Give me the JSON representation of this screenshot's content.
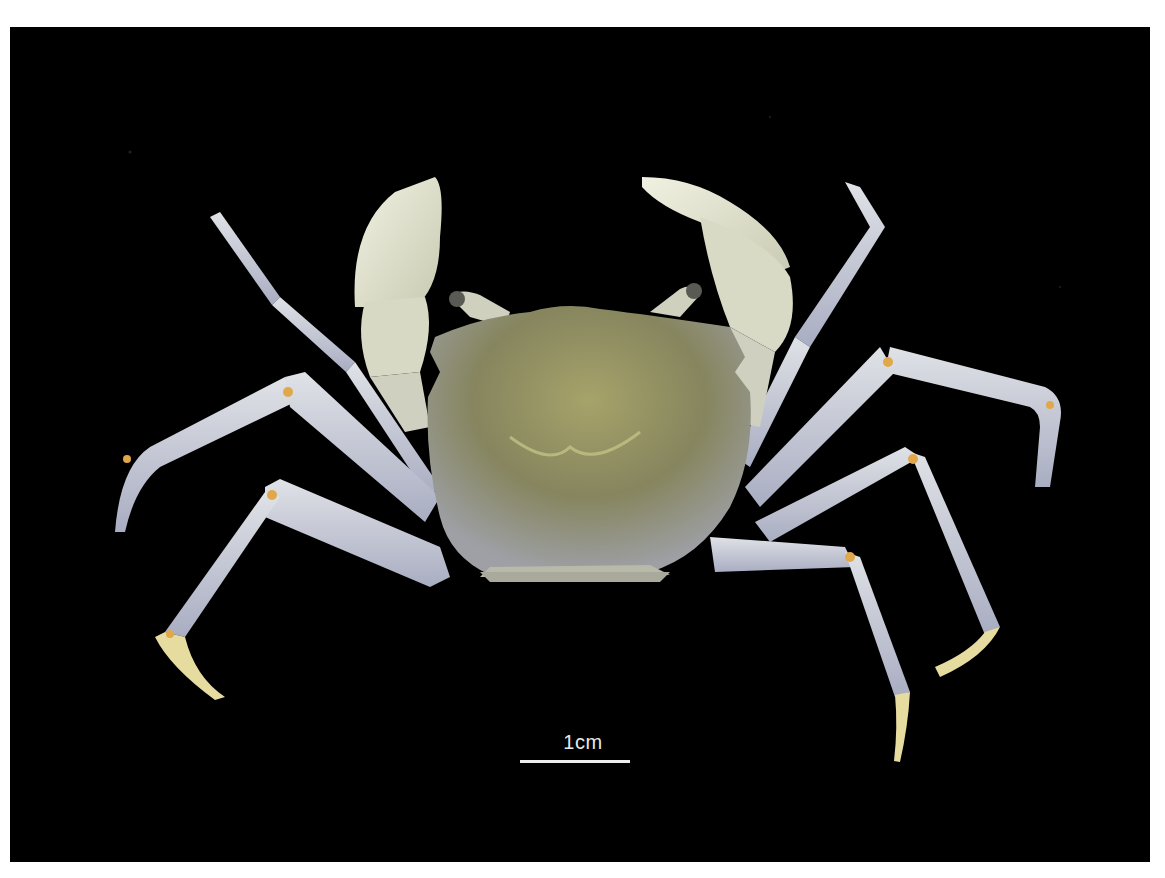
{
  "figure": {
    "background_color": "#000000",
    "margin_color": "#ffffff",
    "scale_bar": {
      "label": "1cm",
      "color": "#eeeeee"
    },
    "colors": {
      "carapace": "#8a8a5e",
      "carapace_highlight": "#b9b77a",
      "legs": "#c9ccd6",
      "legs_shadow": "#9ea2b8",
      "chelae": "#e4e4cf",
      "joints": "#e0a84a",
      "dactyl": "#e6dca0"
    }
  }
}
